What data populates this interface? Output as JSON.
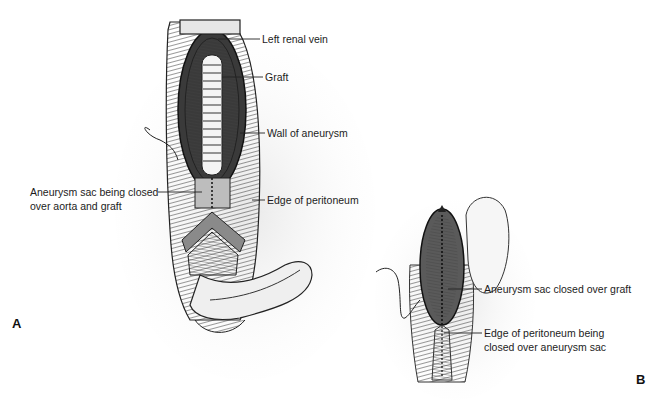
{
  "figure": {
    "panels": [
      {
        "id": "A",
        "letter": "A",
        "labels": [
          {
            "text": "Left renal vein"
          },
          {
            "text": "Graft"
          },
          {
            "text": "Wall of aneurysm"
          },
          {
            "text": "Aneurysm sac being closed",
            "text2": "over aorta and graft"
          },
          {
            "text": "Edge of peritoneum"
          }
        ]
      },
      {
        "id": "B",
        "letter": "B",
        "labels": [
          {
            "text": "Aneurysm sac closed over graft"
          },
          {
            "text": "Edge of peritoneum being",
            "text2": "closed over aneurysm sac"
          }
        ]
      }
    ]
  }
}
